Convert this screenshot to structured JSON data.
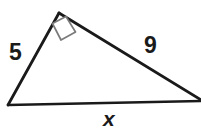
{
  "figure": {
    "type": "right-triangle-diagram",
    "background_color": "#ffffff",
    "stroke_color": "#1a1a1a",
    "text_color": "#1a1a1a",
    "vertices": {
      "apex": {
        "x": 59,
        "y": 13
      },
      "bottom_left": {
        "x": 8,
        "y": 105
      },
      "bottom_right": {
        "x": 203,
        "y": 101
      }
    },
    "right_angle_marker": {
      "at_vertex": "apex",
      "size": 17,
      "fill": "#ffffff",
      "stroke": "#6b6b6b"
    },
    "labels": {
      "left_leg": "5",
      "hypotenuse": "9",
      "base": "x"
    }
  }
}
